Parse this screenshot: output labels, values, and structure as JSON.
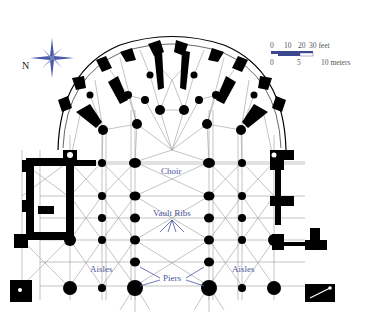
{
  "diagram": {
    "type": "architectural-floor-plan",
    "labels": {
      "choir": "Choir",
      "vault_ribs": "Vault Ribs",
      "aisles_left": "Aisles",
      "aisles_right": "Aisles",
      "piers": "Piers"
    },
    "compass": {
      "direction_label": "N"
    },
    "scale_bar": {
      "feet": {
        "ticks": [
          "0",
          "10",
          "20",
          "30 feet"
        ]
      },
      "meters": {
        "ticks": [
          "0",
          "5",
          "10 meters"
        ]
      }
    },
    "colors": {
      "label_color": "#4a55a0",
      "wall_color": "#000000",
      "rib_line_color": "#9a9a9a",
      "scale_bar_color": "#3c4890",
      "compass_color": "#4a5aa8"
    }
  }
}
